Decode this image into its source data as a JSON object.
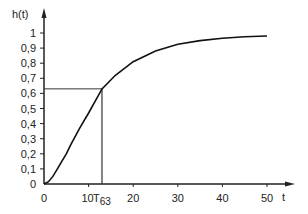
{
  "chart_data": {
    "type": "line",
    "title": "",
    "xlabel": "t",
    "ylabel": "h(t)",
    "xlim": [
      0,
      50
    ],
    "ylim": [
      0,
      1
    ],
    "x_ticks": [
      0,
      10,
      20,
      30,
      40,
      50
    ],
    "y_ticks": [
      "0",
      "0,1",
      "0,2",
      "0,3",
      "0,4",
      "0,5",
      "0,6",
      "0,7",
      "0,8",
      "0,9",
      "1"
    ],
    "grid": false,
    "legend": null,
    "annotations": [
      {
        "label": "T63",
        "x": 13,
        "y": 0.63,
        "description": "Time at which h(t) reaches 63% (projection lines to both axes)"
      }
    ],
    "series": [
      {
        "name": "h(t)",
        "x": [
          0,
          1,
          2,
          3,
          4,
          5,
          6,
          8,
          10,
          13,
          16,
          20,
          25,
          30,
          35,
          40,
          45,
          50
        ],
        "values": [
          0,
          0.015,
          0.05,
          0.1,
          0.15,
          0.2,
          0.26,
          0.37,
          0.47,
          0.63,
          0.72,
          0.81,
          0.88,
          0.925,
          0.95,
          0.965,
          0.975,
          0.98
        ]
      }
    ]
  }
}
